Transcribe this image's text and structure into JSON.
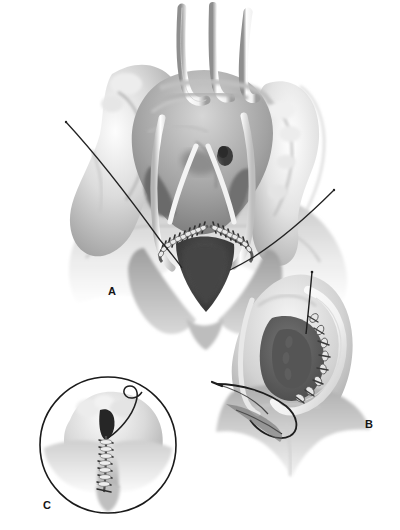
{
  "figure": {
    "kind": "surgical-illustration",
    "style": "grayscale-medical-airbrush",
    "background_color": "#ffffff",
    "ink_color": "#141414",
    "panel_count": 3
  },
  "panels": [
    {
      "id": "A",
      "label": "A",
      "name": "panel-a-main-exposure",
      "description": "Wide operative exposure held open by three curved retractors with suture rows along an inverted-V incision",
      "elements": [
        "three-retractor-hooks",
        "left-tissue-lobe",
        "right-tissue-lobe",
        "inverted-v-incision",
        "suture-row-left",
        "suture-row-right",
        "dark-orifice-spot",
        "left-suture-thread",
        "right-suture-thread"
      ]
    },
    {
      "id": "B",
      "label": "B",
      "name": "panel-b-closeup",
      "description": "Close-up of the sutured margin with curved retractor and a curved needle carrying thread from the left",
      "elements": [
        "curved-retractor",
        "suture-stitch-arc",
        "dark-cavity",
        "curved-needle",
        "needle-thread",
        "vertical-thread-tail"
      ]
    },
    {
      "id": "C",
      "label": "C",
      "name": "panel-c-inset",
      "description": "Circular inset showing the completed vertical suture line with trailing thread",
      "elements": [
        "inset-circle-outline",
        "vertical-suture-ladder",
        "dark-slit",
        "curling-thread-tail"
      ]
    }
  ],
  "labels": {
    "a": "A",
    "b": "B",
    "c": "C"
  },
  "colors": {
    "background": "#ffffff",
    "outline": "#141414",
    "thread": "#1c1c1c",
    "tissue_light": "#f2f2f2",
    "tissue_mid": "#b9b9b9",
    "tissue_dark": "#6e6e6e",
    "cavity_dark": "#4a4a4a",
    "instrument_white": "#fbfbfb"
  }
}
